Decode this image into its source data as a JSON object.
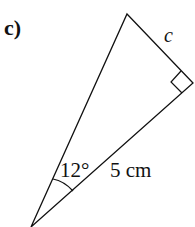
{
  "problem": {
    "part_label": "c)",
    "side_label": "c",
    "angle_label": "12°",
    "hypotenuse_label": "5 cm"
  },
  "colors": {
    "stroke": "#111111",
    "background": "#ffffff"
  }
}
